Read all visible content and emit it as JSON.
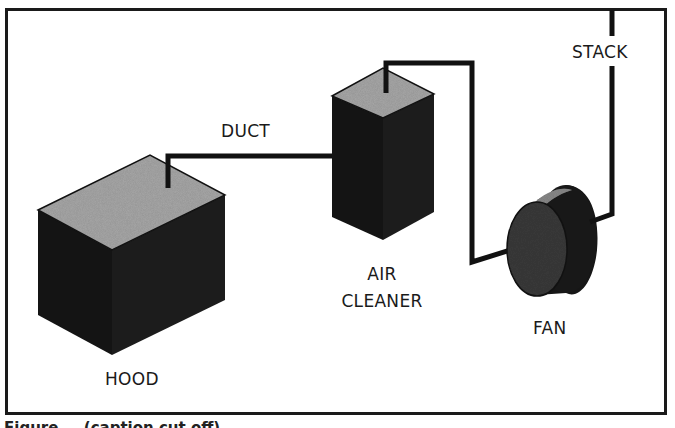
{
  "figure": {
    "labels": {
      "hood": "HOOD",
      "duct": "DUCT",
      "air_cleaner_line1": "AIR",
      "air_cleaner_line2": "CLEANER",
      "fan": "FAN",
      "stack": "STACK"
    },
    "components": [
      {
        "id": "hood",
        "name": "HOOD",
        "shape": "box"
      },
      {
        "id": "duct",
        "name": "DUCT",
        "shape": "line"
      },
      {
        "id": "air_cleaner",
        "name": "AIR CLEANER",
        "shape": "tall-box"
      },
      {
        "id": "fan",
        "name": "FAN",
        "shape": "cylinder"
      },
      {
        "id": "stack",
        "name": "STACK",
        "shape": "line"
      }
    ],
    "flow": [
      "HOOD",
      "DUCT",
      "AIR CLEANER",
      "FAN",
      "STACK"
    ],
    "caption_clipped": "Figure — (caption cut off)"
  },
  "colors": {
    "frame": "#1a1a1a",
    "solid_dark": "#151515",
    "top_face": "#a8a8a8",
    "line": "#111111",
    "background": "#ffffff"
  }
}
